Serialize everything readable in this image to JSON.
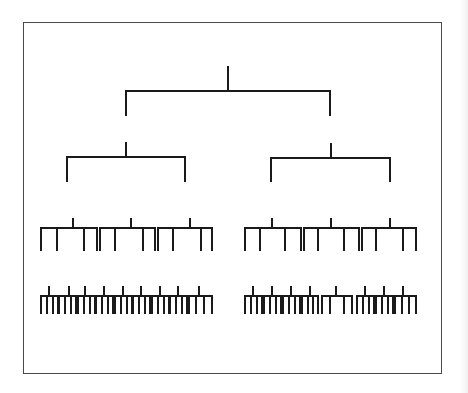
{
  "diagram": {
    "type": "tree-hierarchy",
    "title": "",
    "line_color": "#1a1a1a",
    "frame_color": "#4a4a4a",
    "stroke_width": 2,
    "frame": {
      "x": 23,
      "y": 22,
      "w": 419,
      "h": 352
    },
    "levels": [
      {
        "name": "root",
        "nodes": [
          {
            "stem": [
              228,
              67,
              91
            ],
            "bar": [
              126,
              330,
              91
            ],
            "drops": [
              [
                126,
                115
              ],
              [
                330,
                115
              ]
            ]
          }
        ]
      },
      {
        "name": "level-2",
        "nodes": [
          {
            "stem": [
              126,
              143,
              157
            ],
            "bar": [
              67,
              185,
              157
            ],
            "drops": [
              [
                67,
                181
              ],
              [
                185,
                181
              ]
            ]
          },
          {
            "stem": [
              331,
              144,
              158
            ],
            "bar": [
              271,
              390,
              158
            ],
            "drops": [
              [
                271,
                181
              ],
              [
                390,
                181
              ]
            ]
          }
        ]
      },
      {
        "name": "level-3",
        "top": 228,
        "stem_top": 219,
        "bottom": 250,
        "combs": [
          {
            "x1": 41,
            "x2": 97,
            "stem": 73,
            "leaves": [
              41,
              57,
              84,
              97
            ]
          },
          {
            "x1": 100,
            "x2": 155,
            "stem": 131,
            "leaves": [
              100,
              115,
              143,
              155
            ]
          },
          {
            "x1": 158,
            "x2": 212,
            "stem": 190,
            "leaves": [
              158,
              173,
              201,
              212
            ]
          },
          {
            "x1": 245,
            "x2": 301,
            "stem": 272,
            "leaves": [
              245,
              260,
              285,
              301
            ]
          },
          {
            "x1": 304,
            "x2": 359,
            "stem": 331,
            "leaves": [
              304,
              318,
              344,
              359
            ]
          },
          {
            "x1": 362,
            "x2": 416,
            "stem": 390,
            "leaves": [
              362,
              376,
              403,
              416
            ]
          }
        ]
      },
      {
        "name": "level-4",
        "top": 296,
        "stem_top": 287,
        "bottom": 313,
        "combs": [
          {
            "x1": 41,
            "x2": 58,
            "stem": 49,
            "leaves": [
              41,
              47,
              53,
              58
            ]
          },
          {
            "x1": 59,
            "x2": 76,
            "stem": 69,
            "leaves": [
              59,
              65,
              71,
              76
            ]
          },
          {
            "x1": 78,
            "x2": 95,
            "stem": 85,
            "leaves": [
              78,
              84,
              90,
              95
            ]
          },
          {
            "x1": 96,
            "x2": 113,
            "stem": 104,
            "leaves": [
              96,
              102,
              108,
              113
            ]
          },
          {
            "x1": 115,
            "x2": 132,
            "stem": 123,
            "leaves": [
              115,
              121,
              127,
              132
            ]
          },
          {
            "x1": 133,
            "x2": 150,
            "stem": 141,
            "leaves": [
              133,
              139,
              145,
              150
            ]
          },
          {
            "x1": 152,
            "x2": 169,
            "stem": 160,
            "leaves": [
              152,
              158,
              164,
              169
            ]
          },
          {
            "x1": 170,
            "x2": 187,
            "stem": 178,
            "leaves": [
              170,
              176,
              182,
              187
            ]
          },
          {
            "x1": 189,
            "x2": 212,
            "stem": 199,
            "leaves": [
              189,
              196,
              204,
              212
            ]
          },
          {
            "x1": 245,
            "x2": 262,
            "stem": 253,
            "leaves": [
              245,
              251,
              257,
              262
            ]
          },
          {
            "x1": 264,
            "x2": 281,
            "stem": 272,
            "leaves": [
              264,
              270,
              276,
              281
            ]
          },
          {
            "x1": 283,
            "x2": 300,
            "stem": 291,
            "leaves": [
              283,
              289,
              295,
              300
            ]
          },
          {
            "x1": 302,
            "x2": 318,
            "stem": 310,
            "leaves": [
              302,
              308,
              313,
              318
            ]
          },
          {
            "x1": 322,
            "x2": 352,
            "stem": 336,
            "leaves": [
              322,
              330,
              344,
              352
            ]
          },
          {
            "x1": 357,
            "x2": 374,
            "stem": 365,
            "leaves": [
              357,
              363,
              369,
              374
            ]
          },
          {
            "x1": 376,
            "x2": 393,
            "stem": 384,
            "leaves": [
              376,
              382,
              388,
              393
            ]
          },
          {
            "x1": 395,
            "x2": 416,
            "stem": 403,
            "leaves": [
              395,
              402,
              409,
              416
            ]
          }
        ]
      }
    ]
  }
}
